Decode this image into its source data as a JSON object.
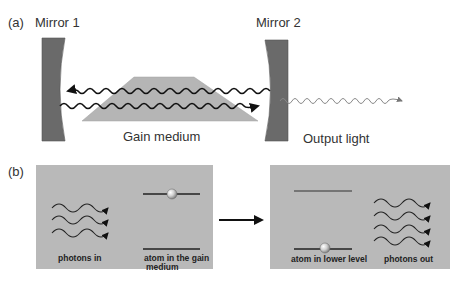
{
  "panel_a": {
    "label": "(a)",
    "mirror1_label": "Mirror 1",
    "mirror2_label": "Mirror 2",
    "gain_medium_label": "Gain medium",
    "output_light_label": "Output light"
  },
  "panel_b": {
    "label": "(b)",
    "before": {
      "photons_label": "photons in",
      "atom_label_line1": "atom in the gain",
      "atom_label_line2": "medium",
      "photon_count": 3
    },
    "after": {
      "atom_label": "atom in lower level",
      "photons_label": "photons out",
      "photon_count": 4
    }
  },
  "colors": {
    "mirror": "#6a6a6a",
    "gain_medium": "#b5b5b5",
    "panel_bg": "#b9b9b9",
    "wave": "#111111",
    "output_wave": "#888888",
    "text": "#333333"
  }
}
